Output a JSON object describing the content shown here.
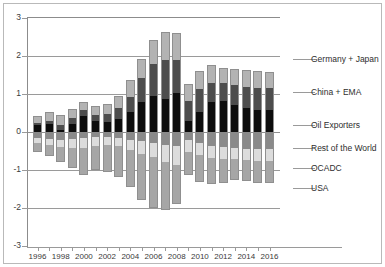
{
  "chart_data": {
    "type": "bar",
    "title": "",
    "subtitle": "",
    "xlabel": "",
    "ylabel": "",
    "stacked": true,
    "grid": true,
    "legend_position": "right",
    "ylim": [
      -3,
      3
    ],
    "yticks": [
      "3",
      "2",
      "1",
      "0",
      "-1",
      "-2",
      "-3"
    ],
    "ytick_values": [
      3,
      2,
      1,
      0,
      -1,
      -2,
      -3
    ],
    "categories": [
      1996,
      1997,
      1998,
      1999,
      2000,
      2001,
      2002,
      2003,
      2004,
      2005,
      2006,
      2007,
      2008,
      2009,
      2010,
      2011,
      2012,
      2013,
      2014,
      2015,
      2016
    ],
    "xtick_labels": [
      "1996",
      "1998",
      "2000",
      "2002",
      "2004",
      "2006",
      "2008",
      "2010",
      "2012",
      "2014",
      "2016"
    ],
    "series": [
      {
        "name": "Germany + Japan",
        "color": "#b3b3b3",
        "values": [
          0.18,
          0.22,
          0.26,
          0.24,
          0.2,
          0.22,
          0.26,
          0.32,
          0.44,
          0.5,
          0.62,
          0.74,
          0.7,
          0.44,
          0.48,
          0.46,
          0.4,
          0.42,
          0.44,
          0.44,
          0.42
        ]
      },
      {
        "name": "China + EMA",
        "color": "#4d4d4d",
        "values": [
          0.06,
          0.1,
          0.14,
          0.14,
          0.16,
          0.16,
          0.22,
          0.28,
          0.4,
          0.62,
          0.86,
          1.04,
          0.88,
          0.52,
          0.6,
          0.5,
          0.46,
          0.52,
          0.56,
          0.58,
          0.58
        ]
      },
      {
        "name": "Oil Exporters",
        "color": "#0d0d0d",
        "values": [
          0.18,
          0.2,
          0.04,
          0.22,
          0.42,
          0.3,
          0.26,
          0.34,
          0.52,
          0.8,
          0.94,
          0.86,
          1.02,
          0.3,
          0.52,
          0.8,
          0.82,
          0.72,
          0.62,
          0.58,
          0.58
        ]
      },
      {
        "name": "Rest of the World",
        "color": "#8a8a8a",
        "values": [
          -0.16,
          -0.18,
          -0.2,
          -0.18,
          -0.16,
          -0.14,
          -0.14,
          -0.16,
          -0.2,
          -0.24,
          -0.28,
          -0.34,
          -0.36,
          -0.22,
          -0.3,
          -0.36,
          -0.4,
          -0.42,
          -0.44,
          -0.46,
          -0.46
        ]
      },
      {
        "name": "OCADC",
        "color": "#dcdcdc",
        "values": [
          -0.14,
          -0.16,
          -0.2,
          -0.24,
          -0.26,
          -0.22,
          -0.2,
          -0.22,
          -0.28,
          -0.34,
          -0.38,
          -0.46,
          -0.5,
          -0.3,
          -0.3,
          -0.32,
          -0.32,
          -0.3,
          -0.3,
          -0.3,
          -0.3
        ]
      },
      {
        "name": "USA",
        "color": "#a6a6a6",
        "values": [
          -0.22,
          -0.3,
          -0.38,
          -0.52,
          -0.7,
          -0.64,
          -0.7,
          -0.8,
          -0.96,
          -1.22,
          -1.34,
          -1.26,
          -1.04,
          -0.62,
          -0.72,
          -0.68,
          -0.62,
          -0.54,
          -0.56,
          -0.58,
          -0.58
        ]
      }
    ],
    "legend_labels": [
      "Germany + Japan",
      "China + EMA",
      "Oil Exporters",
      "Rest of the World",
      "OCADC",
      "USA"
    ]
  },
  "axes": {
    "y_tick_labels": [
      "3",
      "2",
      "1",
      "0",
      "-1",
      "-2",
      "-3"
    ],
    "x_tick_labels": [
      "1996",
      "1998",
      "2000",
      "2002",
      "2004",
      "2006",
      "2008",
      "2010",
      "2012",
      "2014",
      "2016"
    ]
  },
  "legend": {
    "items": [
      {
        "label": "Germany + Japan"
      },
      {
        "label": "China + EMA"
      },
      {
        "label": "Oil Exporters"
      },
      {
        "label": "Rest of the World"
      },
      {
        "label": "OCADC"
      },
      {
        "label": "USA"
      }
    ]
  }
}
